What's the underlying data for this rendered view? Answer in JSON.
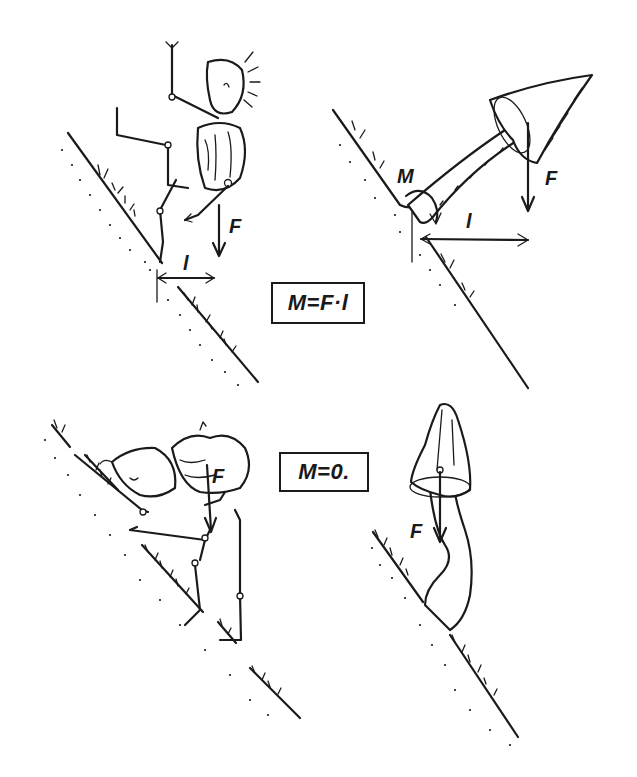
{
  "figure": {
    "panels": [
      {
        "id": "climber-leaning-out",
        "description": "Climber on slope leaning away from the slope; weight acts at a horizontal distance from the foothold",
        "labels": {
          "force": "F",
          "lever_arm": "l"
        }
      },
      {
        "id": "mushroom-leaning-out",
        "description": "Mushroom growing out of a slope at an angle; cap weight creates a moment about the stem base",
        "labels": {
          "moment": "M",
          "force": "F",
          "lever_arm": "l"
        }
      },
      {
        "id": "climber-upright",
        "description": "Climber pressed against the slope; weight line passes through the support",
        "labels": {
          "force": "F"
        }
      },
      {
        "id": "mushroom-upright",
        "description": "Mushroom stem curves so the cap sits vertically above the base",
        "labels": {
          "force": "F"
        }
      }
    ],
    "formulas": {
      "top": "M=F·l",
      "bottom": "M=0."
    }
  },
  "colors": {
    "ink": "#1a1a1a",
    "paper": "#ffffff"
  }
}
